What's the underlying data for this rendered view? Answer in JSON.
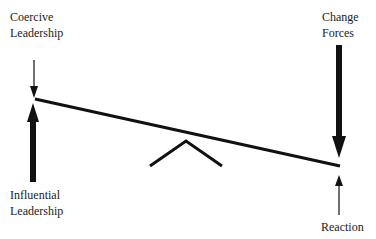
{
  "labels": {
    "coercive": [
      "Coercive",
      "Leadership"
    ],
    "influential": [
      "Influential",
      "Leadership"
    ],
    "change": [
      "Change",
      "Forces"
    ],
    "reaction": [
      "Reaction"
    ]
  },
  "colors": {
    "stroke": "#111111",
    "background": "#ffffff"
  }
}
